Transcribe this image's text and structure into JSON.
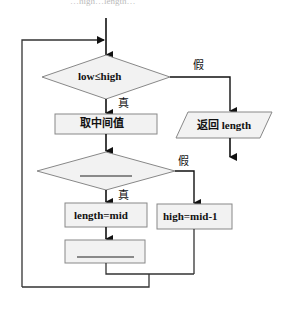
{
  "flowchart": {
    "caption_fragment": "…high…length…",
    "decision1": {
      "label": "low≤high"
    },
    "decision1_false": "假",
    "decision1_true": "真",
    "process_mid": {
      "label": "取中间值"
    },
    "output_return": {
      "label": "返回 length"
    },
    "decision2": {
      "label": "",
      "blank": true
    },
    "decision2_false": "假",
    "decision2_true": "真",
    "process_length": {
      "label": "length=mid"
    },
    "process_high": {
      "label": "high=mid-1"
    },
    "process_blank": {
      "label": "",
      "blank": true
    }
  },
  "colors": {
    "line": "#1a1a1a",
    "box_fill": "#f2f2f2",
    "box_stroke": "#777777"
  }
}
